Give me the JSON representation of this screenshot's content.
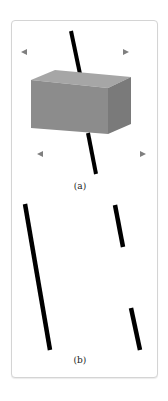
{
  "figure": {
    "panel_a": {
      "label": "(a)",
      "description": "Block sliding along a fault line with opposing horizontal arrows"
    },
    "panel_b": {
      "label": "(b)",
      "description": "Fault line offset after movement, shown as separated segments"
    },
    "colors": {
      "border": "#d4d4d4",
      "block_front": "#8c8c8c",
      "block_top": "#a6a6a6",
      "block_side": "#7a7a7a",
      "line": "#000000",
      "arrow": "#7f7f7f"
    }
  }
}
